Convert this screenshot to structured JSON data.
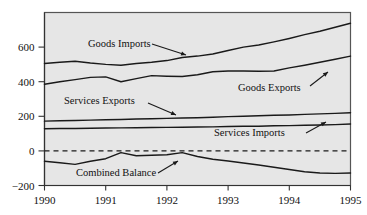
{
  "chart_data": {
    "type": "line",
    "title": "",
    "subtitle": "",
    "xlabel": "",
    "ylabel": "",
    "xlim": [
      1990,
      1995
    ],
    "ylim": [
      -200,
      800
    ],
    "yticks": [
      -200,
      0,
      200,
      400,
      600
    ],
    "ytick_labels": [
      "−200",
      "0",
      "200",
      "400",
      "600"
    ],
    "xticks": [
      1990,
      1991,
      1992,
      1993,
      1994,
      1995
    ],
    "xtick_labels": [
      "1990",
      "1991",
      "1992",
      "1993",
      "1994",
      "1995"
    ],
    "grid": false,
    "legend": "annotations-with-arrows",
    "zero_reference_line": {
      "value": 0,
      "style": "dashed"
    },
    "x": [
      1990.0,
      1990.25,
      1990.5,
      1990.75,
      1991.0,
      1991.25,
      1991.5,
      1991.75,
      1992.0,
      1992.25,
      1992.5,
      1992.75,
      1993.0,
      1993.25,
      1993.5,
      1993.75,
      1994.0,
      1994.25,
      1994.5,
      1994.75,
      1995.0
    ],
    "series": [
      {
        "name": "Goods Imports",
        "values": [
          505,
          512,
          518,
          508,
          500,
          495,
          505,
          512,
          522,
          540,
          548,
          560,
          580,
          600,
          612,
          630,
          650,
          672,
          692,
          715,
          738
        ]
      },
      {
        "name": "Goods Exports",
        "values": [
          385,
          400,
          412,
          425,
          428,
          400,
          418,
          435,
          432,
          430,
          440,
          458,
          462,
          462,
          460,
          462,
          480,
          495,
          512,
          530,
          548
        ]
      },
      {
        "name": "Services Exports",
        "values": [
          172,
          174,
          176,
          178,
          180,
          182,
          184,
          186,
          188,
          190,
          192,
          195,
          198,
          200,
          203,
          206,
          208,
          211,
          214,
          217,
          220
        ]
      },
      {
        "name": "Services Imports",
        "values": [
          128,
          129,
          130,
          131,
          132,
          133,
          134,
          135,
          136,
          137,
          138,
          139,
          141,
          142,
          143,
          145,
          146,
          148,
          150,
          152,
          155
        ]
      },
      {
        "name": "Combined Balance",
        "values": [
          -60,
          -68,
          -78,
          -60,
          -45,
          -10,
          -28,
          -25,
          -22,
          -10,
          -32,
          -48,
          -58,
          -70,
          -82,
          -95,
          -108,
          -120,
          -128,
          -130,
          -128
        ]
      }
    ],
    "annotations": [
      {
        "label": "Goods Imports",
        "target_series": "Goods Imports",
        "arrow_direction": "down-right"
      },
      {
        "label": "Goods Exports",
        "target_series": "Goods Exports",
        "arrow_direction": "up-right"
      },
      {
        "label": "Services Exports",
        "target_series": "Services Exports",
        "arrow_direction": "down-right"
      },
      {
        "label": "Services Imports",
        "target_series": "Services Imports",
        "arrow_direction": "up-right"
      },
      {
        "label": "Combined Balance",
        "target_series": "Combined Balance",
        "arrow_direction": "up-right"
      }
    ],
    "colors": {
      "line": "#1a1a1a",
      "plot_background": "#e6e6e6",
      "plot_border": "#555555",
      "text": "#111111",
      "figure_background": "#ffffff"
    }
  }
}
